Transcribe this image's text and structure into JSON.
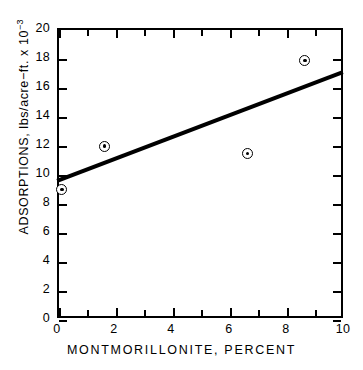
{
  "chart_data": {
    "type": "scatter",
    "title": "",
    "xlabel": "MONTMORILLONITE, PERCENT",
    "ylabel": "ADSORPTIONS,  lbs/acre−ft. x 10",
    "ylabel_exponent": "−3",
    "xlim": [
      0,
      10
    ],
    "ylim": [
      0,
      20
    ],
    "grid": false,
    "legend": null,
    "x_ticks": [
      0,
      1,
      2,
      3,
      4,
      5,
      6,
      7,
      8,
      9,
      10
    ],
    "x_tick_labels": [
      "0",
      "",
      "2",
      "",
      "4",
      "",
      "6",
      "",
      "8",
      "",
      "10"
    ],
    "y_ticks": [
      0,
      2,
      4,
      6,
      8,
      10,
      12,
      14,
      16,
      18,
      20
    ],
    "y_tick_labels": [
      "0",
      "2",
      "4",
      "6",
      "8",
      "10",
      "12",
      "14",
      "16",
      "18",
      "20"
    ],
    "marker": "circle-with-center-dot",
    "points": [
      {
        "x": 0.1,
        "y": 9.0
      },
      {
        "x": 1.6,
        "y": 12.0
      },
      {
        "x": 6.6,
        "y": 11.5
      },
      {
        "x": 8.6,
        "y": 17.9
      }
    ],
    "series": [
      {
        "name": "adsorption-measurements",
        "x": [
          0.1,
          1.6,
          6.6,
          8.6
        ],
        "values": [
          9.0,
          12.0,
          11.5,
          17.9
        ]
      }
    ],
    "trendline": {
      "type": "line",
      "x": [
        0,
        10
      ],
      "values": [
        9.5,
        17.0
      ],
      "color": "#000000",
      "width_px": 4
    },
    "colors": {
      "axis": "#000000",
      "marker": "#000000",
      "line": "#000000",
      "background": "#ffffff"
    }
  }
}
